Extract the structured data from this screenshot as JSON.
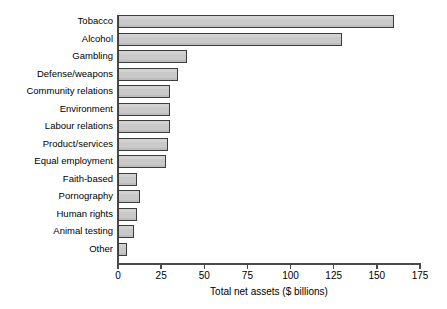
{
  "chart_data": {
    "type": "bar",
    "orientation": "horizontal",
    "title": "",
    "xlabel": "Total net assets ($ billions)",
    "ylabel": "",
    "xlim": [
      0,
      175
    ],
    "xticks": [
      0,
      25,
      50,
      75,
      100,
      125,
      150,
      175
    ],
    "xtick_labels": [
      "0",
      "25",
      "50",
      "75",
      "100",
      "125",
      "150",
      "175"
    ],
    "grid": false,
    "legend": false,
    "bar_color": "#c9c9c9",
    "bar_edge_color": "#3c3c3c",
    "axis_color": "#4a4a4a",
    "categories": [
      "Tobacco",
      "Alcohol",
      "Gambling",
      "Defense/weapons",
      "Community relations",
      "Environment",
      "Labour relations",
      "Product/services",
      "Equal employment",
      "Faith-based",
      "Pornography",
      "Human rights",
      "Animal testing",
      "Other"
    ],
    "values": [
      160,
      130,
      40,
      35,
      30,
      30,
      30,
      29,
      28,
      11,
      13,
      11,
      9,
      5
    ]
  }
}
